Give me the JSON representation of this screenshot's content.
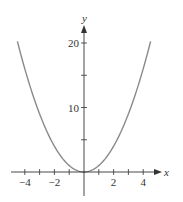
{
  "chart_data": {
    "type": "line",
    "title": "",
    "xlabel": "x",
    "ylabel": "y",
    "function": "y = x^2",
    "xlim": [
      -4.5,
      4.5
    ],
    "ylim": [
      0,
      20
    ],
    "x_ticks": [
      -4,
      -3,
      -2,
      -1,
      0,
      1,
      2,
      3,
      4
    ],
    "x_tick_labels": [
      "−4",
      "−2",
      "2",
      "4"
    ],
    "x_tick_label_values": [
      -4,
      -2,
      2,
      4
    ],
    "y_ticks": [
      5,
      10,
      15,
      20
    ],
    "y_tick_labels": [
      "10",
      "20"
    ],
    "y_tick_label_values": [
      10,
      20
    ],
    "series": [
      {
        "name": "y = x^2",
        "x": [
          -4.5,
          -4,
          -3,
          -2,
          -1,
          0,
          1,
          2,
          3,
          4,
          4.5
        ],
        "values": [
          20.25,
          16,
          9,
          4,
          1,
          0,
          1,
          4,
          9,
          16,
          20.25
        ]
      }
    ],
    "grid": false,
    "legend": null
  },
  "colors": {
    "curve": "#8a8a8a",
    "axis": "#333333"
  }
}
